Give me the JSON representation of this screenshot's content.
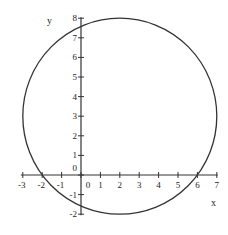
{
  "chart_data": {
    "type": "line",
    "title": "",
    "xlabel": "x",
    "ylabel": "y",
    "xlim": [
      -3,
      7
    ],
    "ylim": [
      -2,
      8
    ],
    "grid": false,
    "legend": null,
    "x_ticks": [
      -3,
      -2,
      -1,
      0,
      1,
      2,
      3,
      4,
      5,
      6,
      7
    ],
    "y_ticks": [
      -2,
      -1,
      0,
      1,
      2,
      3,
      4,
      5,
      6,
      7,
      8
    ],
    "series": [
      {
        "name": "circle",
        "shape": "circle",
        "equation": "(x-2)^2 + (y-3)^2 = 25",
        "center": [
          2,
          3
        ],
        "radius": 5,
        "x_intercepts": [
          -2,
          6
        ],
        "y_intercepts": [
          -1.58,
          7.58
        ]
      }
    ],
    "annotations": []
  },
  "colors": {
    "axis": "#333333",
    "curve": "#333333",
    "background": "#ffffff"
  }
}
